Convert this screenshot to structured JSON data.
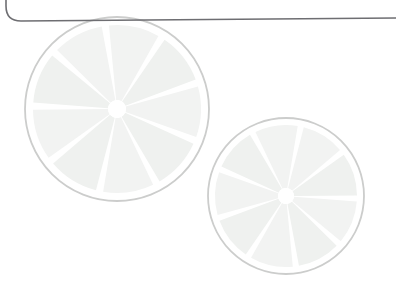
{
  "page": {
    "title": "Citrus slice decorative watermark",
    "background_color": "#ffffff",
    "width": 396,
    "height": 300
  },
  "frame": {
    "name": "rounded-frame-edge",
    "description": "Bottom-left rounded corner of a card border crossing the top of the view",
    "stroke_color": "#6e6e72",
    "stroke_width": 1.6,
    "corner_radius": 16,
    "path": "M 6 -20 L 6 6 Q 6 21 21 21 L 396 18",
    "left_x": 6,
    "corner_y": 21,
    "right_edge_y": 18
  },
  "artwork": {
    "style": "flat watermark",
    "colors": {
      "segment_fill": "#f2f3f2",
      "segment_fill_alt": "#eff1ef",
      "rind_stroke": "#cccdcc",
      "pith_white": "#ffffff",
      "core_white": "#ffffff"
    },
    "slices": [
      {
        "name": "citrus-slice-large",
        "label": "Large citrus slice",
        "center_x": 117,
        "center_y": 109,
        "radius": 92,
        "rind_radius": 92,
        "flesh_radius": 84,
        "core_radius": 9,
        "segments": 9,
        "rotation_deg": -8,
        "gap_deg": 5
      },
      {
        "name": "citrus-slice-small",
        "label": "Small citrus slice",
        "center_x": 286,
        "center_y": 196,
        "radius": 78,
        "rind_radius": 78,
        "flesh_radius": 71,
        "core_radius": 8,
        "segments": 9,
        "rotation_deg": 12,
        "gap_deg": 5
      }
    ]
  }
}
